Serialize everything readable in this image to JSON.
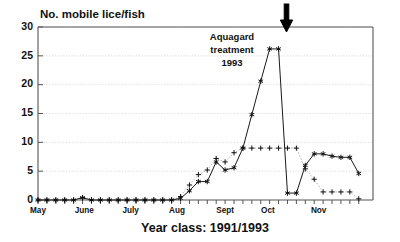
{
  "chart_data": {
    "type": "line",
    "title": "No. mobile lice/fish",
    "xlabel": "Year class: 1991/1993",
    "ylabel": "No. mobile lice/fish",
    "ylim": [
      0,
      30
    ],
    "ytick_labels": [
      "0",
      "5",
      "10",
      "15",
      "20",
      "25",
      "30"
    ],
    "ytick_values": [
      0,
      5,
      10,
      15,
      20,
      25,
      30
    ],
    "xtick_labels": [
      "May",
      "June",
      "July",
      "Aug",
      "Sept",
      "Oct",
      "Nov"
    ],
    "grid": true,
    "legend": "none",
    "annotations": [
      {
        "name": "aquagard-treatment",
        "lines": [
          "Aquagard",
          "treatment",
          "1993"
        ],
        "arrow": "down-arrow",
        "arrow_x_label": "Oct"
      }
    ],
    "x": [
      1,
      2,
      3,
      4,
      5,
      6,
      7,
      8,
      9,
      10,
      11,
      12,
      13,
      14,
      15,
      16,
      17,
      18,
      19,
      20,
      21,
      22,
      23,
      24,
      25,
      26,
      27,
      28,
      29,
      30,
      31,
      32,
      33,
      34,
      35,
      36,
      37
    ],
    "series": [
      {
        "name": "mobile lice (star)",
        "marker": "asterisk",
        "linestyle": "solid",
        "color": "#1a1a1a",
        "values": [
          0,
          0,
          0,
          0,
          0,
          0.4,
          0,
          0,
          0,
          0,
          0,
          0,
          0,
          0,
          0,
          0,
          0.3,
          1.6,
          3.2,
          3.2,
          6.6,
          5.2,
          5.6,
          9.0,
          14.8,
          20.6,
          26.2,
          26.2,
          1.2,
          1.2,
          6.0,
          8.0,
          8.0,
          7.6,
          7.4,
          7.4,
          4.6
        ]
      },
      {
        "name": "sessile lice (plus)",
        "marker": "plus",
        "linestyle": "dotted",
        "color": "#9a9a9a",
        "values": [
          0,
          0,
          0,
          0,
          0,
          0.4,
          0,
          0,
          0,
          0,
          0,
          0,
          0,
          0,
          0,
          0,
          0.6,
          2.6,
          4.4,
          5.2,
          7.2,
          6.6,
          8.2,
          9.0,
          9.0,
          9.0,
          9.0,
          9.0,
          9.0,
          9.0,
          5.4,
          3.6,
          1.4,
          1.4,
          1.4,
          1.4,
          0.2
        ]
      }
    ]
  }
}
